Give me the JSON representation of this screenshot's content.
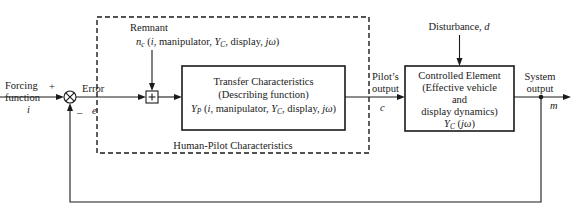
{
  "diagram": {
    "type": "block-diagram",
    "input": {
      "label_line1": "Forcing",
      "label_line2": "function",
      "sign": "+",
      "symbol": "i"
    },
    "summing_junction": {
      "symbol": "⊗",
      "feedback_sign": "–"
    },
    "error": {
      "label": "Error",
      "symbol": "e"
    },
    "human_pilot_block": {
      "label": "Human-Pilot Characteristics",
      "style": "dashed",
      "remnant": {
        "label": "Remnant",
        "expr_n": "n",
        "expr_n_sub": "c",
        "expr_args_1": " (",
        "expr_i": "i",
        "expr_args_2": ", manipulator, ",
        "expr_Y": "Y",
        "expr_Y_sub": "C",
        "expr_args_3": ", display, ",
        "expr_jw": "jω",
        "expr_args_4": ")"
      },
      "remnant_sum_symbol": "+",
      "transfer_block": {
        "line1": "Transfer Characteristics",
        "line2": "(Describing function)",
        "expr_Y": "Y",
        "expr_Y_sub": "P",
        "expr_args_1": " (",
        "expr_i": "i",
        "expr_args_2": ", manipulator, ",
        "expr_YC": "Y",
        "expr_YC_sub": "C",
        "expr_args_3": ", display, ",
        "expr_jw": "jω",
        "expr_args_4": ")"
      }
    },
    "pilot_output": {
      "label_line1": "Pilot’s",
      "label_line2": "output",
      "symbol": "c"
    },
    "disturbance": {
      "label": "Disturbance, ",
      "symbol": "d"
    },
    "controlled_element": {
      "line1": "Controlled Element",
      "line2": "(Effective vehicle",
      "line3": "and",
      "line4": "display dynamics)",
      "expr_Y": "Y",
      "expr_Y_sub": "C",
      "expr_args_1": " (",
      "expr_jw": "jω",
      "expr_args_2": ")"
    },
    "system_output": {
      "label_line1": "System",
      "label_line2": "output",
      "symbol": "m"
    },
    "colors": {
      "stroke": "#1a1a1a",
      "background": "#ffffff"
    }
  }
}
